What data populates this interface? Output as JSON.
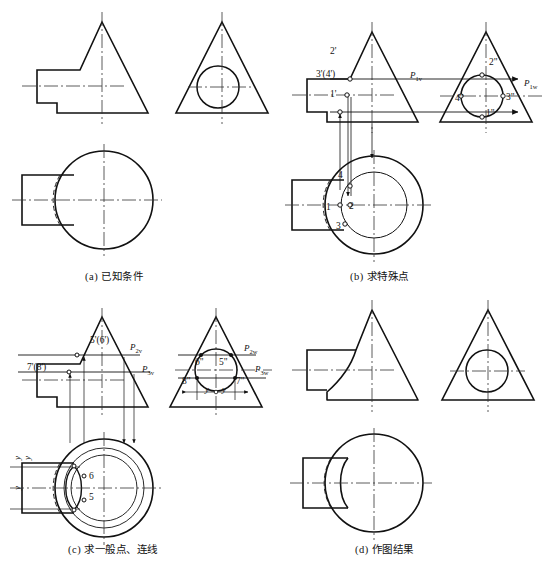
{
  "figure": {
    "panels": [
      {
        "id": "a",
        "caption": "(a) 已知条件",
        "caption_x": 85,
        "caption_y": 270,
        "labels": [],
        "plane_traces": []
      },
      {
        "id": "b",
        "caption": "(b) 求特殊点",
        "caption_x": 350,
        "caption_y": 270,
        "labels": [
          {
            "text": "2'",
            "x": 330,
            "y": 51
          },
          {
            "text": "3'(4')",
            "x": 318,
            "y": 74
          },
          {
            "text": "1'",
            "x": 330,
            "y": 94
          },
          {
            "text": "2\"",
            "x": 491,
            "y": 62
          },
          {
            "text": "4\"",
            "x": 457,
            "y": 98
          },
          {
            "text": "3\"",
            "x": 508,
            "y": 97
          },
          {
            "text": "1\"",
            "x": 487,
            "y": 113
          },
          {
            "text": "4",
            "x": 339,
            "y": 175
          },
          {
            "text": "2",
            "x": 349,
            "y": 205
          },
          {
            "text": "1",
            "x": 327,
            "y": 206
          },
          {
            "text": "3",
            "x": 337,
            "y": 226
          }
        ],
        "plane_traces": [
          {
            "text": "P",
            "sub": "1v",
            "x": 412,
            "y": 76
          },
          {
            "text": "P",
            "sub": "1w",
            "x": 527,
            "y": 84
          }
        ]
      },
      {
        "id": "c",
        "caption": "(c) 求一般点、连线",
        "caption_x": 68,
        "caption_y": 543,
        "labels": [
          {
            "text": "5'(6')",
            "x": 93,
            "y": 340
          },
          {
            "text": "7'(8')",
            "x": 29,
            "y": 367
          },
          {
            "text": "6\"",
            "x": 205,
            "y": 362
          },
          {
            "text": "5\"",
            "x": 222,
            "y": 362
          },
          {
            "text": "8\"",
            "x": 190,
            "y": 379
          },
          {
            "text": "7\"",
            "x": 237,
            "y": 379
          },
          {
            "text": "6",
            "x": 86,
            "y": 475
          },
          {
            "text": "5",
            "x": 86,
            "y": 494
          }
        ],
        "plane_traces": [
          {
            "text": "P",
            "sub": "2v",
            "x": 131,
            "y": 348
          },
          {
            "text": "P",
            "sub": "3v",
            "x": 143,
            "y": 370
          },
          {
            "text": "P",
            "sub": "2w",
            "x": 246,
            "y": 350
          },
          {
            "text": "P",
            "sub": "3w",
            "x": 257,
            "y": 370
          }
        ],
        "dimension_labels": [
          {
            "text": "y",
            "x": 207,
            "y": 397
          },
          {
            "text": "y",
            "x": 224,
            "y": 397
          },
          {
            "text": "y",
            "x": 14,
            "y": 452
          },
          {
            "text": "y",
            "x": 24,
            "y": 452
          },
          {
            "text": "y",
            "x": 14,
            "y": 478
          }
        ]
      },
      {
        "id": "d",
        "caption": "(d) 作图结果",
        "caption_x": 355,
        "caption_y": 543,
        "labels": [],
        "plane_traces": []
      }
    ]
  },
  "style": {
    "outline_color": "#111111",
    "center_line_color": "#333333",
    "thin_line_color": "#222222",
    "background": "#ffffff"
  }
}
